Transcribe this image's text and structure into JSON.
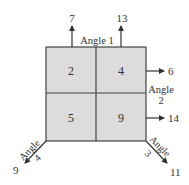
{
  "diagram": {
    "type": "magic-square-grid",
    "colors": {
      "cell_fill": "#dcdcdc",
      "line": "#444444",
      "text": "#333333"
    },
    "cells": [
      {
        "row": 0,
        "col": 0,
        "value": "2"
      },
      {
        "row": 0,
        "col": 1,
        "value": "4"
      },
      {
        "row": 1,
        "col": 0,
        "value": "5"
      },
      {
        "row": 1,
        "col": 1,
        "value": "9"
      }
    ],
    "angles": [
      {
        "name": "Angle 1",
        "label": "Angle 1",
        "outputs": [
          "7",
          "13"
        ],
        "direction": "up"
      },
      {
        "name": "Angle 2",
        "label_line1": "Angle",
        "label_line2": "2",
        "outputs": [
          "6",
          "14"
        ],
        "direction": "right"
      },
      {
        "name": "Angle 3",
        "label_line1": "Angle",
        "label_line2": "3",
        "outputs": [
          "11"
        ],
        "direction": "down-right"
      },
      {
        "name": "Angle 4",
        "label_line1": "Angle",
        "label_line2": "4",
        "outputs": [
          "9"
        ],
        "direction": "down-left"
      }
    ]
  }
}
